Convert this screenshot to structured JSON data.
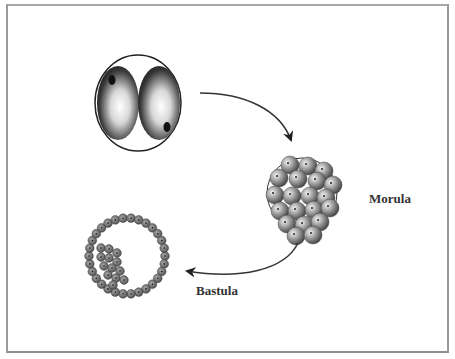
{
  "diagram": {
    "stages": [
      {
        "id": "two-cell",
        "label": ""
      },
      {
        "id": "morula",
        "label": "Morula"
      },
      {
        "id": "blastula",
        "label": "Bastula"
      }
    ],
    "arrows": [
      {
        "from": "two-cell",
        "to": "morula"
      },
      {
        "from": "morula",
        "to": "blastula"
      }
    ],
    "colors": {
      "frame": "#9a9a9a",
      "text": "#333333",
      "cell_gray": "#8a8a8a"
    }
  }
}
